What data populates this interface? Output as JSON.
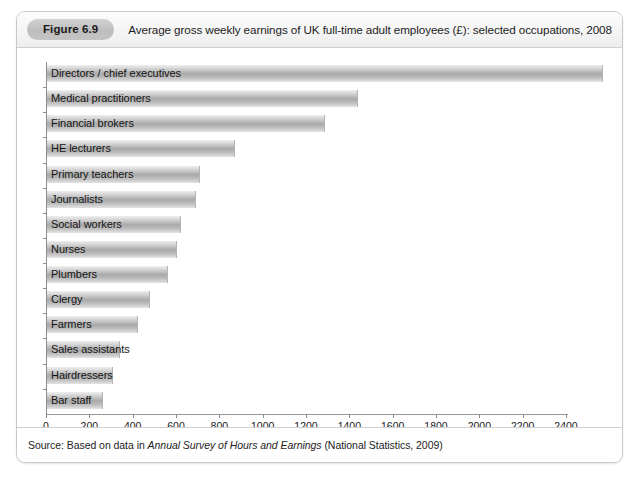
{
  "figure": {
    "badge": "Figure 6.9",
    "title": "Average gross weekly earnings of UK full-time adult employees (£): selected occupations, 2008",
    "source_prefix": "Source: Based on data in ",
    "source_italic": "Annual Survey of Hours and Earnings",
    "source_suffix": " (National Statistics, 2009)"
  },
  "chart_data": {
    "type": "bar",
    "orientation": "horizontal",
    "title": "Average gross weekly earnings of UK full-time adult employees (£): selected occupations, 2008",
    "xlabel": "",
    "ylabel": "",
    "xlim": [
      0,
      2580
    ],
    "grid": false,
    "legend": null,
    "xticks": [
      0,
      200,
      400,
      600,
      800,
      1000,
      1200,
      1400,
      1600,
      1800,
      2000,
      2200,
      2400
    ],
    "xtick_labels": [
      "0",
      "200",
      "400",
      "600",
      "800",
      "1000",
      "1200",
      "1400",
      "1600",
      "1800",
      "2000",
      "2200",
      "2400"
    ],
    "categories": [
      "Directors / chief executives",
      "Medical practitioners",
      "Financial brokers",
      "HE lecturers",
      "Primary teachers",
      "Journalists",
      "Social workers",
      "Nurses",
      "Plumbers",
      "Clergy",
      "Farmers",
      "Sales assistants",
      "Hairdressers",
      "Bar staff"
    ],
    "values": [
      2560,
      1430,
      1280,
      865,
      700,
      685,
      615,
      595,
      555,
      470,
      415,
      330,
      300,
      255
    ],
    "units": "£ per week"
  }
}
